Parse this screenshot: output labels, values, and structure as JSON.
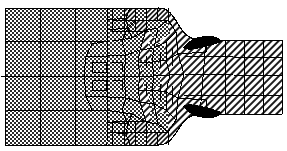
{
  "figure": {
    "type": "fe-mesh-diagram",
    "width": 287,
    "height": 151,
    "background_color": "#ffffff",
    "line_color": "#000000",
    "fill_black": "#000000",
    "fill_white": "#ffffff",
    "patterns": {
      "dotted_label": "stipple-dot-fill",
      "hatched_label": "diagonal-hatch-fill",
      "solid_label": "solid-black-fill"
    },
    "regions": [
      {
        "name": "left-block",
        "pattern": "dotted",
        "x": 5,
        "y": 8,
        "w": 168,
        "h": 137
      },
      {
        "name": "transition-zone",
        "pattern": "mixed",
        "x": 110,
        "y": 8,
        "w": 63,
        "h": 137
      },
      {
        "name": "neck-zone",
        "pattern": "hatched",
        "x": 140,
        "y": 8,
        "w": 48,
        "h": 137
      },
      {
        "name": "right-arm",
        "pattern": "hatched",
        "x": 188,
        "y": 40,
        "w": 94,
        "h": 75
      },
      {
        "name": "upper-black-inclusion",
        "pattern": "solid",
        "x": 178,
        "y": 36,
        "w": 40,
        "h": 14
      },
      {
        "name": "lower-black-inclusion",
        "pattern": "solid",
        "x": 178,
        "y": 100,
        "w": 40,
        "h": 14
      }
    ],
    "marker": {
      "name": "left-edge-tick",
      "x": 3,
      "y": 76
    },
    "notch": {
      "upper_curve_label": "upper notch fillet",
      "lower_curve_label": "lower notch fillet"
    }
  }
}
